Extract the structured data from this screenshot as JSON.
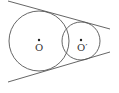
{
  "diagram": {
    "type": "two-intersecting-circles-with-common-tangents",
    "stroke_color": "#555555",
    "circles": [
      {
        "name": "O",
        "label": "O",
        "cx": 39,
        "cy": 41,
        "r": 30
      },
      {
        "name": "O-prime",
        "label": "O′",
        "cx": 81,
        "cy": 41,
        "r": 19
      }
    ],
    "tangent_lines": [
      {
        "name": "upper-tangent",
        "x1": 8,
        "y1": 1,
        "x2": 110,
        "y2": 29
      },
      {
        "name": "lower-tangent",
        "x1": 8,
        "y1": 82,
        "x2": 110,
        "y2": 52
      }
    ],
    "labels": {
      "center_o": "O",
      "center_o_prime": "O′"
    }
  }
}
